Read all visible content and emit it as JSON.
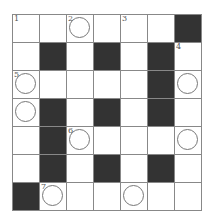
{
  "puzzle": {
    "rows": 7,
    "cols": 7,
    "cells": [
      [
        {
          "t": "w",
          "n": "1"
        },
        {
          "t": "w"
        },
        {
          "t": "c",
          "n": "2"
        },
        {
          "t": "w"
        },
        {
          "t": "w",
          "n": "3"
        },
        {
          "t": "w"
        },
        {
          "t": "b"
        }
      ],
      [
        {
          "t": "w"
        },
        {
          "t": "b"
        },
        {
          "t": "w"
        },
        {
          "t": "b"
        },
        {
          "t": "w"
        },
        {
          "t": "b"
        },
        {
          "t": "w",
          "n": "4"
        }
      ],
      [
        {
          "t": "c",
          "n": "5"
        },
        {
          "t": "w"
        },
        {
          "t": "w"
        },
        {
          "t": "w"
        },
        {
          "t": "w"
        },
        {
          "t": "b"
        },
        {
          "t": "c"
        }
      ],
      [
        {
          "t": "c"
        },
        {
          "t": "b"
        },
        {
          "t": "w"
        },
        {
          "t": "b"
        },
        {
          "t": "w"
        },
        {
          "t": "b"
        },
        {
          "t": "w"
        }
      ],
      [
        {
          "t": "w"
        },
        {
          "t": "b"
        },
        {
          "t": "c",
          "n": "6"
        },
        {
          "t": "w"
        },
        {
          "t": "w"
        },
        {
          "t": "w"
        },
        {
          "t": "c"
        }
      ],
      [
        {
          "t": "w"
        },
        {
          "t": "b"
        },
        {
          "t": "w"
        },
        {
          "t": "b"
        },
        {
          "t": "w"
        },
        {
          "t": "b"
        },
        {
          "t": "w"
        }
      ],
      [
        {
          "t": "b"
        },
        {
          "t": "c",
          "n": "7"
        },
        {
          "t": "w"
        },
        {
          "t": "w"
        },
        {
          "t": "c"
        },
        {
          "t": "w"
        },
        {
          "t": "w"
        }
      ]
    ]
  },
  "colors": {
    "black_cell": "#333333",
    "grid_line": "#888888",
    "circle": "#777777"
  }
}
